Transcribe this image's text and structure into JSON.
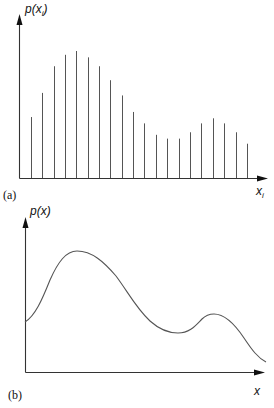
{
  "figure": {
    "panel_a": {
      "tag": "(a)",
      "y_label": "p(x",
      "y_label_sub": "i",
      "y_label_close": ")",
      "x_label": "x",
      "x_label_sub": "i"
    },
    "panel_b": {
      "tag": "(b)",
      "y_label": "p(x)",
      "x_label": "x"
    }
  },
  "chart_data": [
    {
      "type": "bar",
      "title": "(a) discrete distribution p(x_i)",
      "xlabel": "x_i",
      "ylabel": "p(x_i)",
      "grid": false,
      "categories": [
        "1",
        "2",
        "3",
        "4",
        "5",
        "6",
        "7",
        "8",
        "9",
        "10",
        "11",
        "12",
        "13",
        "14",
        "15",
        "16",
        "17",
        "18",
        "19",
        "20"
      ],
      "x_px": [
        31,
        42,
        54,
        65,
        76,
        88,
        99,
        110,
        122,
        133,
        144,
        156,
        167,
        179,
        190,
        201,
        213,
        224,
        236,
        247
      ],
      "values": [
        0.48,
        0.67,
        0.88,
        0.97,
        1.0,
        0.95,
        0.88,
        0.77,
        0.65,
        0.52,
        0.43,
        0.34,
        0.31,
        0.31,
        0.36,
        0.43,
        0.47,
        0.43,
        0.36,
        0.27
      ]
    },
    {
      "type": "line",
      "title": "(b) continuous density p(x)",
      "xlabel": "x",
      "ylabel": "p(x)",
      "grid": false,
      "x": [
        0,
        0.1,
        0.2,
        0.3,
        0.4,
        0.5,
        0.6,
        0.7,
        0.75,
        0.8,
        0.9,
        1.0
      ],
      "values": [
        0.42,
        0.82,
        0.99,
        0.9,
        0.65,
        0.43,
        0.32,
        0.36,
        0.48,
        0.47,
        0.27,
        0.08
      ]
    }
  ]
}
